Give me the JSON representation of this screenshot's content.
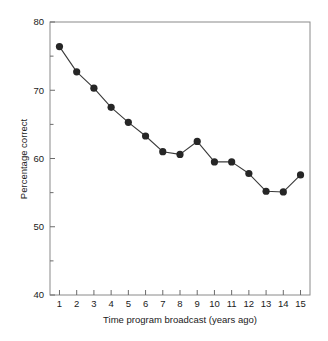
{
  "chart_data": {
    "type": "line",
    "title": "",
    "subtitle": "",
    "xlabel": "Time program broadcast (years ago)",
    "ylabel": "Percentage correct",
    "x": [
      1,
      2,
      3,
      4,
      5,
      6,
      7,
      8,
      9,
      10,
      11,
      12,
      13,
      14,
      15
    ],
    "values": [
      76.4,
      72.7,
      70.3,
      67.5,
      65.3,
      63.3,
      61.0,
      60.6,
      62.5,
      59.5,
      59.5,
      57.8,
      55.2,
      55.1,
      57.6
    ],
    "series": [
      {
        "name": "Percentage correct",
        "values": [
          76.4,
          72.7,
          70.3,
          67.5,
          65.3,
          63.3,
          61.0,
          60.6,
          62.5,
          59.5,
          59.5,
          57.8,
          55.2,
          55.1,
          57.6
        ]
      }
    ],
    "xlim": [
      0.45,
      15.55
    ],
    "ylim": [
      40,
      80
    ],
    "xticks": [
      1,
      2,
      3,
      4,
      5,
      6,
      7,
      8,
      9,
      10,
      11,
      12,
      13,
      14,
      15
    ],
    "xtick_labels": [
      "1",
      "2",
      "3",
      "4",
      "5",
      "6",
      "7",
      "8",
      "9",
      "10",
      "11",
      "12",
      "13",
      "14",
      "15"
    ],
    "yticks": [
      40,
      50,
      60,
      70,
      80
    ],
    "ytick_labels": [
      "40",
      "50",
      "60",
      "70",
      "80"
    ],
    "yticks_minor": [
      45,
      55,
      65,
      75
    ],
    "grid": false,
    "legend": false,
    "legend_position": "none",
    "marker": "filled-circle",
    "marker_color": "#262626",
    "line_color": "#3a3a3a",
    "axis_color": "#8a8a8a",
    "background": "#ffffff"
  }
}
